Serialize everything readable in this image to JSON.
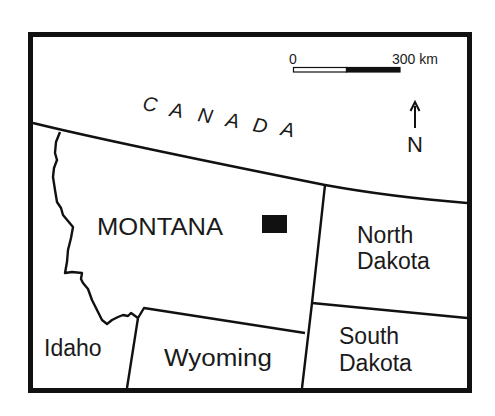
{
  "map": {
    "regions": {
      "canada": "CANADA",
      "canada_letters": [
        "C",
        "A",
        "N",
        "A",
        "D",
        "A"
      ],
      "montana": "MONTANA",
      "north_dakota_line1": "North",
      "north_dakota_line2": "Dakota",
      "south_dakota_line1": "South",
      "south_dakota_line2": "Dakota",
      "idaho": "Idaho",
      "wyoming": "Wyoming"
    },
    "scale_bar": {
      "start_label": "0",
      "end_label": "300 km"
    },
    "north_arrow": {
      "label": "N",
      "icon": "north-arrow-icon"
    },
    "study_site_marker": {
      "icon": "filled-square-marker",
      "color": "#111111"
    },
    "colors": {
      "line": "#111111",
      "background": "#ffffff"
    }
  }
}
